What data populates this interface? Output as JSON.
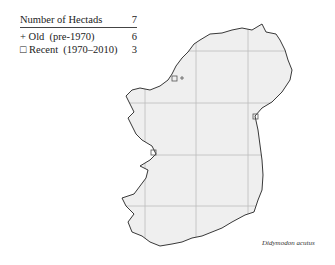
{
  "legend": {
    "header_label": "Number of Hectads",
    "header_value": "7",
    "rows": [
      {
        "symbol": "+",
        "label": "Old  (pre-1970)",
        "value": "6"
      },
      {
        "symbol": "□",
        "label": "Recent  (1970–2010)",
        "value": "3"
      }
    ]
  },
  "map": {
    "region": "Ireland",
    "land_color": "#efefef",
    "coast_color": "#222222",
    "grid_color": "#bdbdbd"
  },
  "species_label": "Didymodon acutus"
}
